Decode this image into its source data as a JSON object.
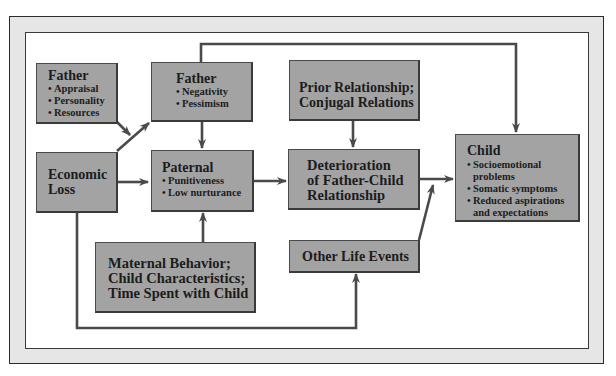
{
  "diagram": {
    "colors": {
      "box_fill": "#a3a3a3",
      "arrow": "#4a4a4a",
      "frame": "#e6e6e6"
    },
    "nodes": {
      "father_factors": {
        "title": "Father",
        "items": [
          "Appraisal",
          "Personality",
          "Resources"
        ]
      },
      "father_attitudes": {
        "title": "Father",
        "items": [
          "Negativity",
          "Pessimism"
        ]
      },
      "prior_relationship": {
        "lines": [
          "Prior Relationship;",
          "Conjugal Relations"
        ]
      },
      "economic_loss": {
        "lines": [
          "Economic",
          "Loss"
        ]
      },
      "paternal": {
        "title": "Paternal",
        "items": [
          "Punitiveness",
          "Low nurturance"
        ]
      },
      "deterioration": {
        "lines": [
          "Deterioration",
          "of Father-Child",
          "Relationship"
        ]
      },
      "child": {
        "title": "Child",
        "items": [
          {
            "line1": "Socioemotional",
            "line2": "problems"
          },
          {
            "line1": "Somatic symptoms",
            "line2": ""
          },
          {
            "line1": "Reduced aspirations",
            "line2": "and expectations"
          }
        ]
      },
      "maternal": {
        "lines": [
          "Maternal Behavior;",
          "Child Characteristics;",
          "Time Spent with Child"
        ]
      },
      "other_life_events": {
        "lines": [
          "Other Life Events"
        ]
      }
    },
    "bullet": "•",
    "edges": [
      {
        "from": "Father (Appraisal/Personality/Resources)",
        "to": "Father (Negativity/Pessimism)"
      },
      {
        "from": "Economic Loss",
        "to": "Father (Negativity/Pessimism)"
      },
      {
        "from": "Economic Loss",
        "to": "Paternal"
      },
      {
        "from": "Economic Loss",
        "to": "Other Life Events"
      },
      {
        "from": "Father (Negativity/Pessimism)",
        "to": "Paternal"
      },
      {
        "from": "Father (Negativity/Pessimism)",
        "to": "Child"
      },
      {
        "from": "Maternal Behavior; Child Characteristics; Time Spent with Child",
        "to": "Paternal"
      },
      {
        "from": "Paternal",
        "to": "Deterioration of Father-Child Relationship"
      },
      {
        "from": "Prior Relationship; Conjugal Relations",
        "to": "Deterioration of Father-Child Relationship"
      },
      {
        "from": "Deterioration of Father-Child Relationship",
        "to": "Child"
      },
      {
        "from": "Other Life Events",
        "to": "Child"
      }
    ]
  }
}
